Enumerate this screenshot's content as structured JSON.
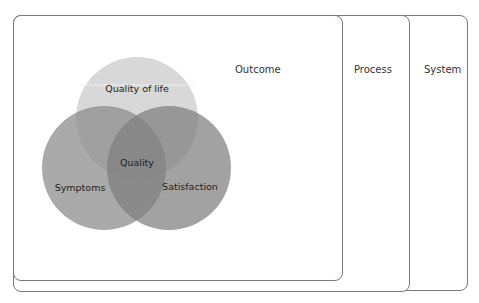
{
  "diagram": {
    "boxes": [
      {
        "id": "system",
        "label": "System"
      },
      {
        "id": "process",
        "label": "Process"
      },
      {
        "id": "outcome",
        "label": "Outcome"
      }
    ],
    "venn": {
      "circles": [
        {
          "id": "quality-of-life",
          "label": "Quality of life",
          "color": "#d4d4d4"
        },
        {
          "id": "symptoms",
          "label": "Symptoms",
          "color": "#8e8e8e"
        },
        {
          "id": "satisfaction",
          "label": "Satisfaction",
          "color": "#7e7e7e"
        }
      ],
      "center_label": "Quality"
    }
  }
}
